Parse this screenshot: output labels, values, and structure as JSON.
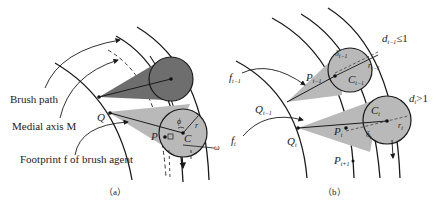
{
  "figure": {
    "panel_a": {
      "caption": "（a）",
      "labels": {
        "brush_path": "Brush path",
        "medial_axis": "Medial axis M",
        "footprint": "Footprint f of brush agent",
        "Q": "Q",
        "P": "P",
        "C": "C",
        "r": "r",
        "phi": "ϕ",
        "omega": "ω"
      }
    },
    "panel_b": {
      "caption": "（b）",
      "labels": {
        "d_prev": "d",
        "d_prev_sub": "t−1",
        "d_prev_cond": "≤1",
        "d_t": "d",
        "d_t_sub": "t",
        "d_t_cond": ">1",
        "f_prev": "f",
        "f_prev_sub": "t−1",
        "f_t": "f",
        "f_t_sub": "t",
        "Q_prev": "Q",
        "Q_prev_sub": "t−1",
        "Q_t": "Q",
        "Q_t_sub": "t",
        "P_prev": "P",
        "P_prev_sub": "t−1",
        "P_t": "P",
        "P_t_sub": "t",
        "P_next": "P",
        "P_next_sub": "t+1",
        "C_prev": "C",
        "C_prev_sub": "t−1",
        "C_t": "C",
        "C_t_sub": "t",
        "r_prev": "r",
        "r_prev_sub": "t−1",
        "r_t": "r",
        "r_t_sub": "t",
        "delta_prev": "δ",
        "delta_prev_sub": "t−1",
        "delta_t": "δ",
        "delta_t_sub": "t"
      }
    },
    "colors": {
      "dark_fill": "#6e6e6e",
      "light_fill": "#b9b9b9",
      "stroke": "#1a1a1a"
    }
  }
}
